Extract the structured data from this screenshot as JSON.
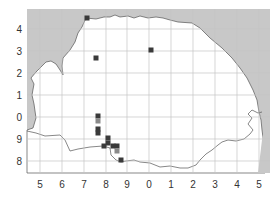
{
  "map": {
    "colors": {
      "sea": "#c8c8c8",
      "land": "#ffffff",
      "grid": "#c4c4c4",
      "coastline": "#555555",
      "marker_dark": "#3a3a3a",
      "marker_gray": "#8a8a8a",
      "label": "#333333"
    },
    "x_ticks": [
      {
        "label": "5",
        "x": 40
      },
      {
        "label": "6",
        "x": 62
      },
      {
        "label": "7",
        "x": 84
      },
      {
        "label": "8",
        "x": 106
      },
      {
        "label": "9",
        "x": 127
      },
      {
        "label": "0",
        "x": 149
      },
      {
        "label": "1",
        "x": 171
      },
      {
        "label": "2",
        "x": 193
      },
      {
        "label": "3",
        "x": 215
      },
      {
        "label": "4",
        "x": 237
      },
      {
        "label": "5",
        "x": 259
      }
    ],
    "y_ticks": [
      {
        "label": "4",
        "y": 29
      },
      {
        "label": "3",
        "y": 51
      },
      {
        "label": "2",
        "y": 73
      },
      {
        "label": "1",
        "y": 95
      },
      {
        "label": "0",
        "y": 117
      },
      {
        "label": "9",
        "y": 139
      },
      {
        "label": "8",
        "y": 161
      }
    ],
    "markers": [
      {
        "x": 87,
        "y": 18,
        "shade": "dark"
      },
      {
        "x": 96,
        "y": 58,
        "shade": "dark"
      },
      {
        "x": 151,
        "y": 50,
        "shade": "dark"
      },
      {
        "x": 98,
        "y": 116,
        "shade": "dark"
      },
      {
        "x": 98,
        "y": 121,
        "shade": "gray"
      },
      {
        "x": 98,
        "y": 129,
        "shade": "dark"
      },
      {
        "x": 98,
        "y": 133,
        "shade": "dark"
      },
      {
        "x": 108,
        "y": 138,
        "shade": "dark"
      },
      {
        "x": 108,
        "y": 143,
        "shade": "dark"
      },
      {
        "x": 104,
        "y": 146,
        "shade": "dark"
      },
      {
        "x": 113,
        "y": 146,
        "shade": "dark"
      },
      {
        "x": 117,
        "y": 146,
        "shade": "dark"
      },
      {
        "x": 117,
        "y": 151,
        "shade": "gray"
      },
      {
        "x": 121,
        "y": 160,
        "shade": "dark"
      }
    ]
  }
}
